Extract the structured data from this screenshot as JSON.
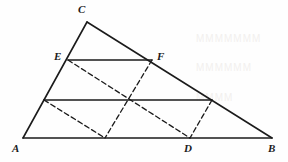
{
  "figure": {
    "background_color": "#fefefe",
    "stroke_color": "#1b1b1b",
    "solid_stroke_width": 1.6,
    "dashed_stroke_width": 1.3,
    "dash_pattern": "5,3"
  },
  "points": {
    "A": {
      "label": "A",
      "x": 23,
      "y": 138,
      "label_x": 12,
      "label_y": 143
    },
    "B": {
      "label": "B",
      "x": 272,
      "y": 138,
      "label_x": 268,
      "label_y": 143
    },
    "C": {
      "label": "C",
      "x": 87,
      "y": 22,
      "label_x": 78,
      "label_y": 4
    },
    "D": {
      "label": "D",
      "x": 190,
      "y": 138,
      "label_x": 184,
      "label_y": 143
    },
    "E": {
      "label": "E",
      "x": 68,
      "y": 60,
      "label_x": 54,
      "label_y": 51
    },
    "F": {
      "label": "F",
      "x": 152,
      "y": 60,
      "label_x": 157,
      "label_y": 51
    },
    "G": {
      "label": "",
      "x": 44,
      "y": 100,
      "label_x": 0,
      "label_y": 0
    },
    "H": {
      "label": "",
      "x": 212,
      "y": 100,
      "label_x": 0,
      "label_y": 0
    },
    "K": {
      "label": "",
      "x": 105,
      "y": 138,
      "label_x": 0,
      "label_y": 0
    },
    "M": {
      "label": "",
      "x": 130,
      "y": 100,
      "label_x": 0,
      "label_y": 0
    }
  },
  "solid_segments": [
    {
      "name": "side-AC",
      "from": "A",
      "to": "C"
    },
    {
      "name": "side-CB",
      "from": "C",
      "to": "B"
    },
    {
      "name": "side-AB",
      "from": "A",
      "to": "B"
    },
    {
      "name": "segment-EF",
      "from": "E",
      "to": "F"
    },
    {
      "name": "segment-GH",
      "from": "G",
      "to": "H"
    }
  ],
  "dashed_segments": [
    {
      "name": "dashed-E-to-D",
      "from": "E",
      "to": "D"
    },
    {
      "name": "dashed-F-to-K",
      "from": "F",
      "to": "K"
    },
    {
      "name": "dashed-G-to-K",
      "from": "G",
      "to": "K"
    },
    {
      "name": "dashed-H-to-D",
      "from": "H",
      "to": "D"
    }
  ],
  "labels": [
    {
      "name": "vertex-label-C",
      "key": "C"
    },
    {
      "name": "vertex-label-E",
      "key": "E"
    },
    {
      "name": "vertex-label-F",
      "key": "F"
    },
    {
      "name": "vertex-label-A",
      "key": "A"
    },
    {
      "name": "vertex-label-D",
      "key": "D"
    },
    {
      "name": "vertex-label-B",
      "key": "B"
    }
  ],
  "artifacts": {
    "ghost_line_1": "MMMMMMM",
    "ghost_line_2": "MMMMMM",
    "ghost_line_3": "MMMM"
  }
}
